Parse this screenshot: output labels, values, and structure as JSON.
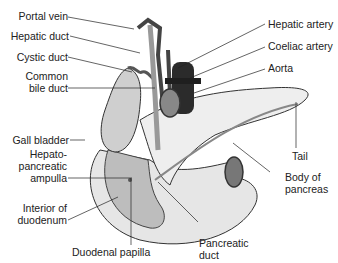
{
  "labels": {
    "portal_vein": "Portal vein",
    "hepatic_duct": "Hepatic duct",
    "cystic_duct": "Cystic duct",
    "common_bile_duct_1": "Common",
    "common_bile_duct_2": "bile duct",
    "gall_bladder": "Gall bladder",
    "hepato_1": "Hepato-",
    "hepato_2": "pancreatic",
    "hepato_3": "ampulla",
    "interior_1": "Interior of",
    "interior_2": "duodenum",
    "duodenal_papilla": "Duodenal papilla",
    "pancreatic_duct_1": "Pancreatic",
    "pancreatic_duct_2": "duct",
    "body_1": "Body of",
    "body_2": "pancreas",
    "tail": "Tail",
    "hepatic_artery": "Hepatic artery",
    "coeliac_artery": "Coeliac artery",
    "aorta": "Aorta"
  },
  "colors": {
    "outline": "#333333",
    "organ_fill": "#dcdcdc",
    "pancreas_fill": "#eeeeee",
    "vessel_dark": "#2b2b2b",
    "duct_fill": "#bdbdbd"
  }
}
